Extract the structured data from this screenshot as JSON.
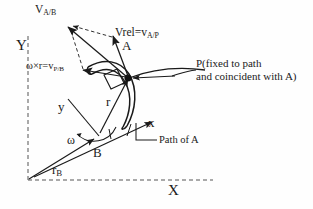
{
  "figure": {
    "type": "kinematics-vector-diagram",
    "background_color": "#fefefe",
    "stroke_color": "#1a1a1a"
  },
  "global_frame": {
    "y_axis_label": "Y",
    "x_axis_label": "X",
    "origin_x": 28,
    "origin_y": 180,
    "style": "dashed"
  },
  "body_frame": {
    "y_axis_label": "y",
    "x_axis_label": "x",
    "origin_label": "B"
  },
  "points": {
    "a_label": "A",
    "b_label": "B",
    "p_note_line1": "P(fixed to path",
    "p_note_line2": "and coincident with A)"
  },
  "vectors": {
    "v_ab": {
      "label": "V",
      "sub": "A/B"
    },
    "v_rel": {
      "label": "Vrel=v",
      "sub": "A/P"
    },
    "omega_cross_r": {
      "label": "ω×r=v",
      "sub": "P/B"
    },
    "r_rel": {
      "label": "r"
    },
    "r_b": {
      "label": "r",
      "sub": "B"
    }
  },
  "annotations": {
    "omega_symbol": "ω",
    "path_of_a": "Path of A"
  }
}
